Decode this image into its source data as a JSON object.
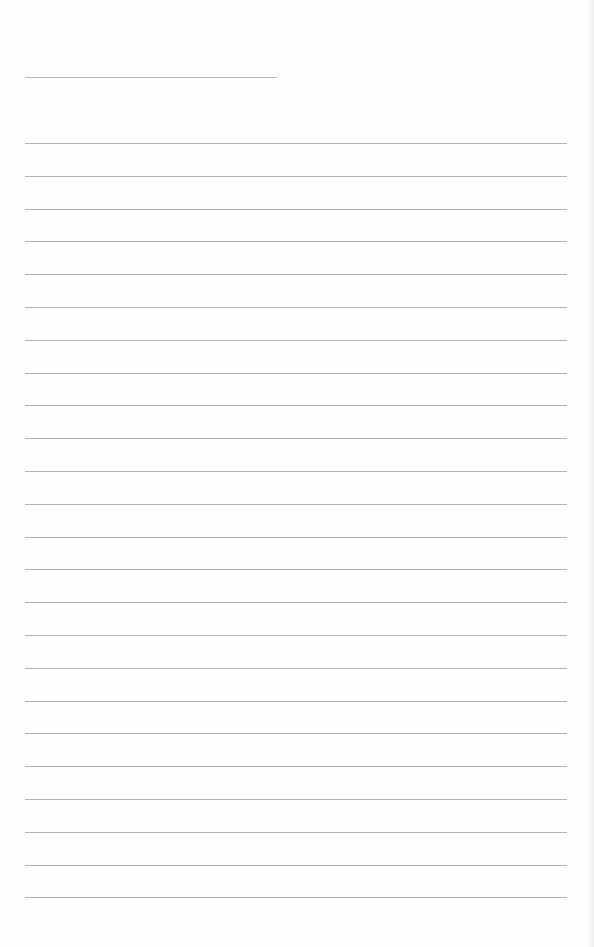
{
  "document": {
    "type": "lined-paper",
    "header_line": {
      "x": 25,
      "y": 77,
      "width": 252,
      "label": ""
    },
    "rules": {
      "count": 24,
      "start_y": 143,
      "spacing": 32.8,
      "left": 25,
      "width": 542
    },
    "line_color": "#b0b0b0",
    "paper_color": "#fefefe"
  }
}
